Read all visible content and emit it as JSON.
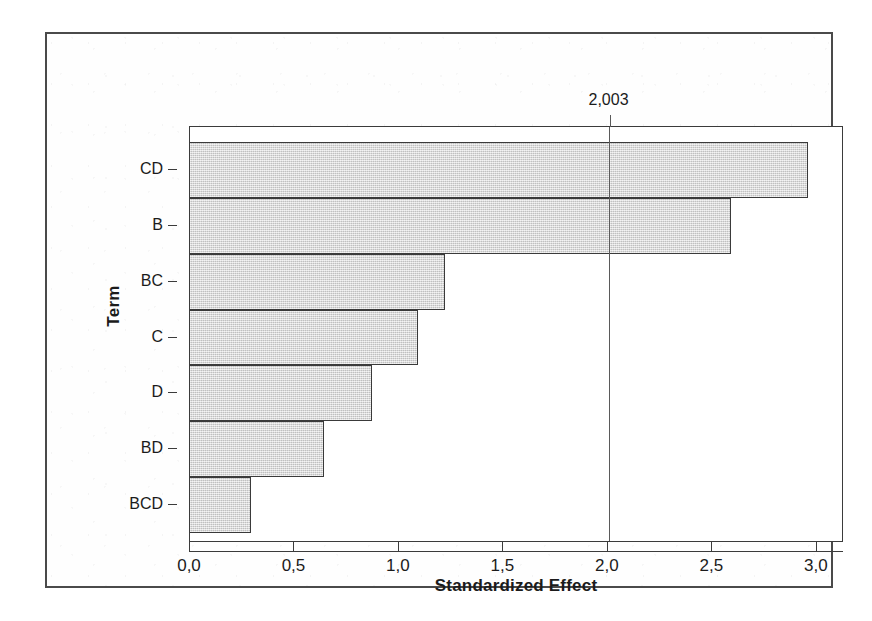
{
  "chart_data": {
    "type": "bar",
    "orientation": "horizontal",
    "title": "",
    "xlabel": "Standardized Effect",
    "ylabel": "Term",
    "categories": [
      "CD",
      "B",
      "BC",
      "C",
      "D",
      "BD",
      "BCD"
    ],
    "values": [
      2.96,
      2.59,
      1.22,
      1.09,
      0.87,
      0.64,
      0.29
    ],
    "xlim": [
      0.0,
      3.13
    ],
    "xticks": [
      0.0,
      0.5,
      1.0,
      1.5,
      2.0,
      2.5,
      3.0
    ],
    "xticklabels": [
      "0,0",
      "0,5",
      "1,0",
      "1,5",
      "2,0",
      "2,5",
      "3,0"
    ],
    "grid": false,
    "legend": null,
    "reference_line": {
      "value": 2.003,
      "label": "2,003",
      "orientation": "vertical"
    },
    "decimal_separator": ",",
    "colors": {
      "bar_fill": "#d5d5d5",
      "bar_edge": "#3a3a3a",
      "axis": "#3b3b3b",
      "text": "#1b1b1b",
      "reference_line": "#5a5a5a",
      "frame": "#4a4a4a",
      "background": "#ffffff"
    }
  }
}
